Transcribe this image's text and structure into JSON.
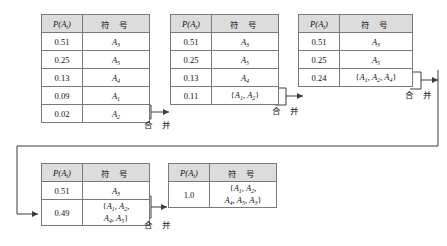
{
  "diagram": {
    "columns": {
      "prob": "P(A<sub>i</sub>)",
      "prob_plain": "P(A",
      "prob_sub": "i",
      "prob_tail": ")",
      "symbol": "符 号"
    },
    "merge_label": "合 并",
    "colors": {
      "header_fill": "#dcdcdc",
      "border": "#5a5a5a",
      "inner_border": "#7a7a7a",
      "wire": "#3c3c3c",
      "text": "#101010"
    }
  },
  "tables": [
    {
      "id": "table-1",
      "rows": [
        {
          "prob": "0.51",
          "sym_base": "A",
          "sym_sub": "3",
          "sym_text": "A3"
        },
        {
          "prob": "0.25",
          "sym_base": "A",
          "sym_sub": "5",
          "sym_text": "A5"
        },
        {
          "prob": "0.13",
          "sym_base": "A",
          "sym_sub": "4",
          "sym_text": "A4"
        },
        {
          "prob": "0.09",
          "sym_base": "A",
          "sym_sub": "1",
          "sym_text": "A1"
        },
        {
          "prob": "0.02",
          "sym_base": "A",
          "sym_sub": "2",
          "sym_text": "A2"
        }
      ]
    },
    {
      "id": "table-2",
      "rows": [
        {
          "prob": "0.51",
          "sym_base": "A",
          "sym_sub": "3",
          "sym_text": "A3"
        },
        {
          "prob": "0.25",
          "sym_base": "A",
          "sym_sub": "5",
          "sym_text": "A5"
        },
        {
          "prob": "0.13",
          "sym_base": "A",
          "sym_sub": "4",
          "sym_text": "A4"
        },
        {
          "prob": "0.11",
          "sym_set": [
            "A1",
            "A2"
          ],
          "sym_text": "{A1, A2}"
        }
      ]
    },
    {
      "id": "table-3",
      "rows": [
        {
          "prob": "0.51",
          "sym_base": "A",
          "sym_sub": "3",
          "sym_text": "A3"
        },
        {
          "prob": "0.25",
          "sym_base": "A",
          "sym_sub": "5",
          "sym_text": "A5"
        },
        {
          "prob": "0.24",
          "sym_set": [
            "A1",
            "A2",
            "A4"
          ],
          "sym_text": "{A1, A2, A4}"
        }
      ]
    },
    {
      "id": "table-4",
      "rows": [
        {
          "prob": "0.51",
          "sym_base": "A",
          "sym_sub": "3",
          "sym_text": "A3"
        },
        {
          "prob": "0.49",
          "sym_set": [
            "A1",
            "A2",
            "A4",
            "A5"
          ],
          "sym_text": "{A1, A2, A4, A5}"
        }
      ]
    },
    {
      "id": "table-5",
      "rows": [
        {
          "prob": "1.0",
          "sym_set": [
            "A1",
            "A2",
            "A4",
            "A5",
            "A3"
          ],
          "sym_text": "{A1, A2, A4, A5, A3}"
        }
      ]
    }
  ],
  "merges": [
    {
      "id": "merge-1"
    },
    {
      "id": "merge-2"
    },
    {
      "id": "merge-3"
    },
    {
      "id": "merge-4"
    }
  ]
}
